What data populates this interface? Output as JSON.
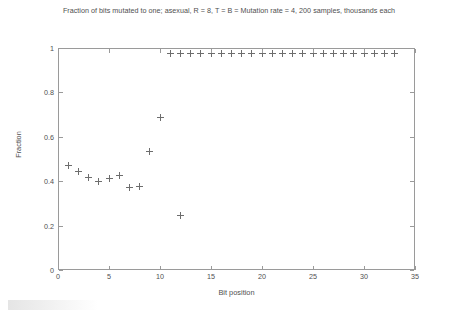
{
  "chart_data": {
    "type": "scatter",
    "title": "Fraction of bits mutated to one; asexual, R = 8, T = B = Mutation rate = 4, 200 samples, thousands each",
    "xlabel": "Bit position",
    "ylabel": "Fraction",
    "xlim": [
      0,
      35
    ],
    "ylim": [
      0,
      1
    ],
    "xticks": [
      0,
      5,
      10,
      15,
      20,
      25,
      30,
      35
    ],
    "xticklabels": [
      "0",
      "5",
      "10",
      "15",
      "20",
      "25",
      "30",
      "35"
    ],
    "yticks": [
      0,
      0.2,
      0.4,
      0.6,
      0.8,
      1
    ],
    "yticklabels": [
      "0",
      "0.2",
      "0.4",
      "0.6",
      "0.8",
      "1"
    ],
    "grid": false,
    "legend": null,
    "marker": "plus",
    "marker_color": "#6d6d6d",
    "series": [
      {
        "name": "Fraction of bits mutated to one",
        "points": [
          {
            "x": 1,
            "y": 0.47
          },
          {
            "x": 2,
            "y": 0.445
          },
          {
            "x": 3,
            "y": 0.415
          },
          {
            "x": 4,
            "y": 0.4
          },
          {
            "x": 5,
            "y": 0.41
          },
          {
            "x": 6,
            "y": 0.425
          },
          {
            "x": 7,
            "y": 0.37
          },
          {
            "x": 8,
            "y": 0.375
          },
          {
            "x": 9,
            "y": 0.535
          },
          {
            "x": 10,
            "y": 0.685
          },
          {
            "x": 11,
            "y": 0.975
          },
          {
            "x": 12,
            "y": 0.245
          },
          {
            "x": 12,
            "y": 0.975
          },
          {
            "x": 13,
            "y": 0.975
          },
          {
            "x": 14,
            "y": 0.975
          },
          {
            "x": 15,
            "y": 0.975
          },
          {
            "x": 16,
            "y": 0.975
          },
          {
            "x": 17,
            "y": 0.975
          },
          {
            "x": 18,
            "y": 0.975
          },
          {
            "x": 19,
            "y": 0.975
          },
          {
            "x": 20,
            "y": 0.975
          },
          {
            "x": 21,
            "y": 0.975
          },
          {
            "x": 22,
            "y": 0.975
          },
          {
            "x": 23,
            "y": 0.975
          },
          {
            "x": 24,
            "y": 0.975
          },
          {
            "x": 25,
            "y": 0.975
          },
          {
            "x": 26,
            "y": 0.975
          },
          {
            "x": 27,
            "y": 0.975
          },
          {
            "x": 28,
            "y": 0.975
          },
          {
            "x": 29,
            "y": 0.975
          },
          {
            "x": 30,
            "y": 0.975
          },
          {
            "x": 31,
            "y": 0.975
          },
          {
            "x": 32,
            "y": 0.975
          },
          {
            "x": 33,
            "y": 0.975
          }
        ]
      }
    ]
  }
}
